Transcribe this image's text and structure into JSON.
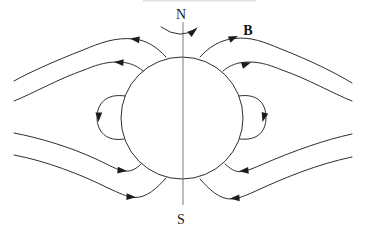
{
  "diagram": {
    "kind": "magnetic-field-around-rotating-sphere",
    "labels": {
      "north": "N",
      "south": "S",
      "field": "B"
    },
    "colors": {
      "stroke": "#2e2e2e",
      "axis": "#6b6b6b",
      "background": "#ffffff"
    }
  }
}
